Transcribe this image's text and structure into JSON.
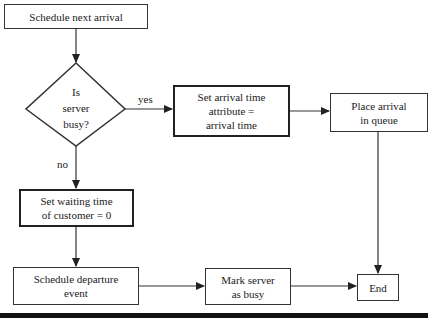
{
  "flowchart": {
    "nodes": {
      "schedule_next_arrival": "Schedule next arrival",
      "decision": {
        "line1": "Is",
        "line2": "server",
        "line3": "busy?"
      },
      "set_arrival_time": {
        "line1": "Set arrival time",
        "line2": "attribute =",
        "line3": "arrival time"
      },
      "place_arrival": {
        "line1": "Place arrival",
        "line2": "in queue"
      },
      "set_waiting_time": {
        "line1": "Set waiting time",
        "line2": "of customer = 0"
      },
      "schedule_departure": {
        "line1": "Schedule departure",
        "line2": "event"
      },
      "mark_server": {
        "line1": "Mark server",
        "line2": "as busy"
      },
      "end": "End"
    },
    "edge_labels": {
      "yes": "yes",
      "no": "no"
    }
  }
}
